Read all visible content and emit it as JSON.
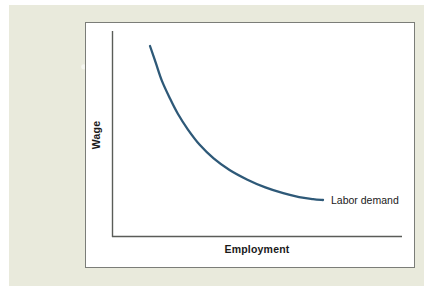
{
  "figure": {
    "background_color": "#ffffff",
    "mat_color": "#e9eadc",
    "panel_color": "#ffffff",
    "panel_border_color": "#7b7d78",
    "axis_color": "#5a5c58",
    "curve_color": "#2e5978",
    "text_color": "#1a1a1a"
  },
  "chart_data": {
    "type": "line",
    "title": "",
    "subtitle": "",
    "xlabel": "Employment",
    "ylabel": "Wage",
    "grid": false,
    "legend_position": "inline-right-of-curve",
    "axis_ticks": {
      "x": [],
      "y": []
    },
    "xlim": [
      0,
      1
    ],
    "ylim": [
      0,
      1
    ],
    "series": [
      {
        "name": "Labor demand",
        "color": "#2e5978",
        "line_width": 2.3,
        "annotation": "Labor demand",
        "x": [
          0.13,
          0.16,
          0.19,
          0.23,
          0.27,
          0.32,
          0.38,
          0.45,
          0.53,
          0.62,
          0.71,
          0.8,
          0.88,
          0.95,
          1.0
        ],
        "y": [
          0.93,
          0.84,
          0.75,
          0.66,
          0.58,
          0.5,
          0.42,
          0.35,
          0.29,
          0.24,
          0.2,
          0.17,
          0.15,
          0.14,
          0.135
        ]
      }
    ]
  },
  "labels": {
    "y_axis": "Wage",
    "x_axis": "Employment",
    "curve": "Labor demand"
  }
}
